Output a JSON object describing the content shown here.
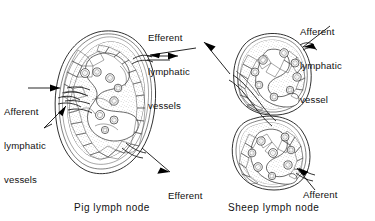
{
  "figure": {
    "type": "anatomical-line-diagram",
    "background_color": "#ffffff",
    "ink_color": "#1a1a1a"
  },
  "labels": {
    "afferent_left": {
      "line1": "Afferent",
      "line2": "lymphatic",
      "line3": "vessels",
      "full": "Afferent lymphatic vessels"
    },
    "efferent_top": {
      "line1": "Efferent",
      "line2": "lymphatic",
      "line3": "vessels",
      "full": "Efferent lymphatic vessels"
    },
    "efferent_bottom": {
      "line1": "Efferent",
      "line2": "lymphatic",
      "line3": "vessels",
      "full": "Efferent lymphatic vessels"
    },
    "afferent_top_right": {
      "line1": "Afferent",
      "line2": "lymphatic",
      "line3": "vessel",
      "full": "Afferent lymphatic vessel"
    },
    "afferent_bottom_right": {
      "line1": "Afferent",
      "line2": "lymphatic",
      "line3": "vessel",
      "full": "Afferent lymphatic vessel"
    }
  },
  "captions": {
    "left": "Pig lymph node",
    "right": "Sheep lymph node"
  },
  "diagrams": [
    {
      "name": "pig-lymph-node",
      "shape": "bean-shaped, single lobe with medial hilum",
      "afferent_side": "hilum (medial, left)",
      "efferent_sides": [
        "upper right periphery",
        "lower right periphery"
      ]
    },
    {
      "name": "sheep-lymph-node",
      "shape": "bilobed, rounded",
      "afferent_sides": [
        "upper right periphery",
        "lower right periphery"
      ],
      "efferent_side": "hilum (medial, upper left)"
    }
  ]
}
